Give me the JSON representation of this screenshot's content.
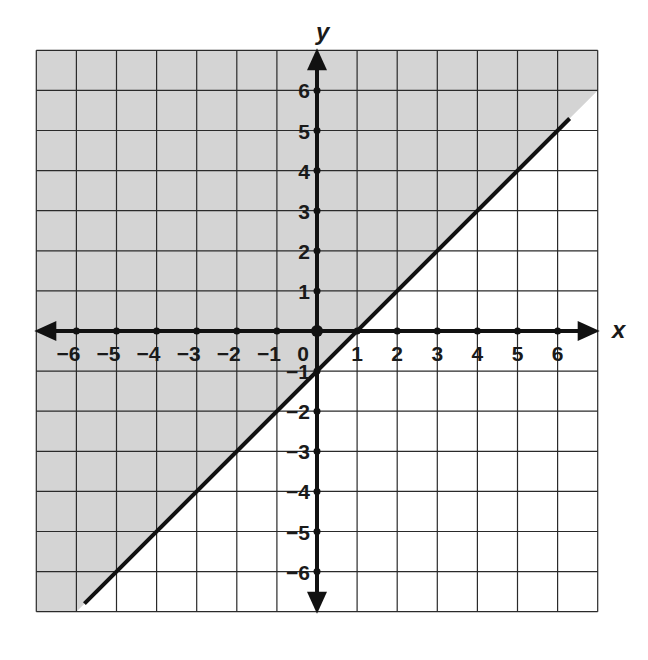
{
  "chart_data": {
    "type": "line",
    "title": "",
    "xlabel": "x",
    "ylabel": "y",
    "xlim": [
      -7,
      7
    ],
    "ylim": [
      -7,
      7
    ],
    "grid": true,
    "grid_step": 1,
    "x_ticks": [
      -6,
      -5,
      -4,
      -3,
      -2,
      -1,
      0,
      1,
      2,
      3,
      4,
      5,
      6
    ],
    "y_ticks": [
      -6,
      -5,
      -4,
      -3,
      -2,
      -1,
      1,
      2,
      3,
      4,
      5,
      6
    ],
    "x_tick_labels": [
      "−6",
      "−5",
      "−4",
      "−3",
      "−2",
      "−1",
      "0",
      "1",
      "2",
      "3",
      "4",
      "5",
      "6"
    ],
    "y_tick_labels": [
      "−6",
      "−5",
      "−4",
      "−3",
      "−2",
      "−1",
      "1",
      "2",
      "3",
      "4",
      "5",
      "6"
    ],
    "origin_label": "0",
    "series": [
      {
        "name": "boundary line",
        "equation": "y = x - 1",
        "style": "solid",
        "slope": 1,
        "intercept": -1,
        "x": [
          -5.8,
          6.3
        ],
        "y": [
          -6.8,
          5.3
        ],
        "key_points": [
          [
            0,
            -1
          ],
          [
            1,
            0
          ],
          [
            2,
            1
          ],
          [
            3,
            2
          ],
          [
            4,
            3
          ],
          [
            5,
            4
          ],
          [
            -1,
            -2
          ],
          [
            -2,
            -3
          ],
          [
            -3,
            -4
          ],
          [
            -4,
            -5
          ],
          [
            -5,
            -6
          ]
        ]
      }
    ],
    "shaded_region": {
      "inequality": "y ≥ x − 1",
      "side": "above",
      "color": "#d4d4d4"
    },
    "colors": {
      "axis": "#111111",
      "grid": "#2a2a2a",
      "line": "#111111",
      "shade": "#d4d4d4",
      "background": "#ffffff"
    }
  },
  "labels": {
    "x_axis": "x",
    "y_axis": "y",
    "origin": "0"
  }
}
